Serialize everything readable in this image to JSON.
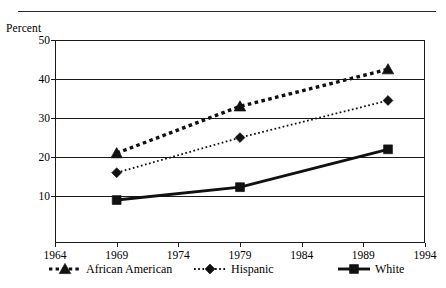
{
  "chart_data": {
    "type": "line",
    "title": "",
    "subtitle": "",
    "xlabel": "",
    "ylabel": "Percent",
    "ylabel_position": "top-left",
    "xlim": [
      1964,
      1994
    ],
    "ylim": [
      -2,
      50
    ],
    "grid": true,
    "grid_axis": "y",
    "legend_position": "bottom",
    "x_ticks": [
      1964,
      1969,
      1974,
      1979,
      1984,
      1989,
      1994
    ],
    "x_tick_labels": [
      "1964",
      "1969",
      "1974",
      "1979",
      "1984",
      "1989",
      "1994"
    ],
    "y_ticks": [
      10,
      20,
      30,
      40,
      50
    ],
    "y_tick_labels": [
      "10",
      "20",
      "30",
      "40",
      "50"
    ],
    "x": [
      1969,
      1979,
      1991
    ],
    "series": [
      {
        "name": "African American",
        "marker": "triangle",
        "line_style": "dotted-heavy",
        "color": "#111111",
        "values": [
          21,
          33,
          42.5
        ]
      },
      {
        "name": "Hispanic",
        "marker": "diamond",
        "line_style": "dotted-fine",
        "color": "#111111",
        "values": [
          16,
          25,
          34.5
        ]
      },
      {
        "name": "White",
        "marker": "square",
        "line_style": "solid",
        "color": "#111111",
        "values": [
          9,
          12.3,
          22
        ]
      }
    ],
    "legend_entries": [
      "African American",
      "Hispanic",
      "White"
    ]
  },
  "axis": {
    "y_caption": "Percent"
  },
  "legend": {
    "items": [
      {
        "label": "African American",
        "marker": "triangle-marker-icon"
      },
      {
        "label": "Hispanic",
        "marker": "diamond-marker-icon"
      },
      {
        "label": "White",
        "marker": "square-marker-icon"
      }
    ]
  }
}
